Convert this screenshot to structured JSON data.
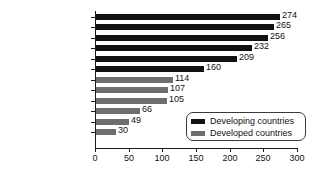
{
  "chart_data": {
    "type": "bar",
    "orientation": "horizontal",
    "title": "",
    "xlabel": "",
    "ylabel": "",
    "xlim": [
      0,
      300
    ],
    "xticks": [
      0,
      50,
      100,
      150,
      200,
      250,
      300
    ],
    "grid": false,
    "legend_position": "bottom-right",
    "categories": [
      "India",
      "Egypt",
      "Philippines",
      "Mexico",
      "China",
      "Chile",
      "Canada",
      "United States",
      "Australia",
      "United Kingdom",
      "Italy",
      "Japan"
    ],
    "values": [
      274,
      265,
      256,
      232,
      209,
      160,
      114,
      107,
      105,
      66,
      49,
      30
    ],
    "groups": [
      "developing",
      "developing",
      "developing",
      "developing",
      "developing",
      "developing",
      "developed",
      "developed",
      "developed",
      "developed",
      "developed",
      "developed"
    ],
    "series": [
      {
        "name": "Developing countries",
        "color": "#111111",
        "points": [
          {
            "category": "India",
            "value": 274
          },
          {
            "category": "Egypt",
            "value": 265
          },
          {
            "category": "Philippines",
            "value": 256
          },
          {
            "category": "Mexico",
            "value": 232
          },
          {
            "category": "China",
            "value": 209
          },
          {
            "category": "Chile",
            "value": 160
          }
        ]
      },
      {
        "name": "Developed countries",
        "color": "#6e6e6e",
        "points": [
          {
            "category": "Canada",
            "value": 114
          },
          {
            "category": "United States",
            "value": 107
          },
          {
            "category": "Australia",
            "value": 105
          },
          {
            "category": "United Kingdom",
            "value": 66
          },
          {
            "category": "Italy",
            "value": 49
          },
          {
            "category": "Japan",
            "value": 30
          }
        ]
      }
    ]
  },
  "legend": {
    "items": [
      {
        "label": "Developing countries",
        "group": "developing"
      },
      {
        "label": "Developed countries",
        "group": "developed"
      }
    ]
  },
  "axis": {
    "x_tick_labels": [
      "0",
      "50",
      "100",
      "150",
      "200",
      "250",
      "300"
    ]
  }
}
